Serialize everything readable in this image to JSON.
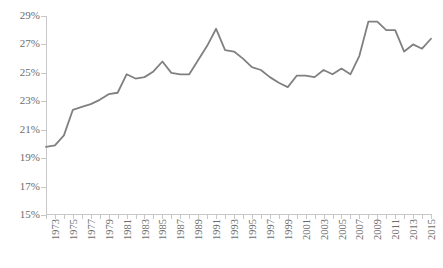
{
  "chart_data": {
    "type": "line",
    "title": "",
    "subtitle": "",
    "xlabel": "",
    "ylabel": "",
    "ylim": [
      15,
      29
    ],
    "ytick_values": [
      15,
      17,
      19,
      21,
      23,
      25,
      27,
      29
    ],
    "ytick_labels": [
      "15%",
      "17%",
      "19%",
      "21%",
      "23%",
      "25%",
      "27%",
      "29%"
    ],
    "xlim": [
      1973,
      2016
    ],
    "xtick_labels": [
      "1973",
      "1975",
      "1977",
      "1979",
      "1981",
      "1983",
      "1985",
      "1987",
      "1989",
      "1991",
      "1993",
      "1995",
      "1997",
      "1999",
      "2001",
      "2003",
      "2005",
      "2007",
      "2009",
      "2011",
      "2013",
      "2015"
    ],
    "grid": false,
    "legend": "none",
    "annotations": [],
    "series": [
      {
        "name": "series-1",
        "color": "#808080",
        "x": [
          1973,
          1974,
          1975,
          1976,
          1977,
          1978,
          1979,
          1980,
          1981,
          1982,
          1983,
          1984,
          1985,
          1986,
          1987,
          1988,
          1989,
          1990,
          1991,
          1992,
          1993,
          1994,
          1995,
          1996,
          1997,
          1998,
          1999,
          2000,
          2001,
          2002,
          2003,
          2004,
          2005,
          2006,
          2007,
          2008,
          2009,
          2010,
          2011,
          2012,
          2013,
          2014,
          2015,
          2016
        ],
        "values": [
          19.8,
          19.9,
          20.6,
          22.4,
          22.6,
          22.8,
          23.1,
          23.5,
          23.6,
          24.9,
          24.6,
          24.7,
          25.1,
          25.8,
          25.0,
          24.9,
          24.9,
          25.9,
          26.9,
          28.1,
          26.6,
          26.5,
          26.0,
          25.4,
          25.2,
          24.7,
          24.3,
          24.0,
          24.8,
          24.8,
          24.7,
          25.2,
          24.9,
          25.3,
          24.9,
          26.2,
          28.6,
          28.6,
          28.0,
          28.0,
          26.5,
          27.0,
          26.7,
          27.4
        ]
      }
    ]
  },
  "axes": {
    "y_label_suffix": "%",
    "axis_color": "#c8c8c8"
  }
}
